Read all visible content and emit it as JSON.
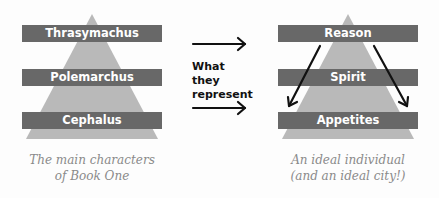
{
  "left_pyramid": {
    "levels": [
      "Thrasymachus",
      "Polemarchus",
      "Cephalus"
    ],
    "caption_line1": "The main characters",
    "caption_line2": "of Book One"
  },
  "middle": {
    "line1": "What",
    "line2": "they",
    "line3": "represent"
  },
  "right_pyramid": {
    "levels": [
      "Reason",
      "Spirit",
      "Appetites"
    ],
    "caption_line1": "An ideal individual",
    "caption_line2": "(and an ideal city!)"
  },
  "colors": {
    "triangle": "#b9b9b9",
    "banner": "#686868",
    "caption": "#8a8a8a"
  }
}
